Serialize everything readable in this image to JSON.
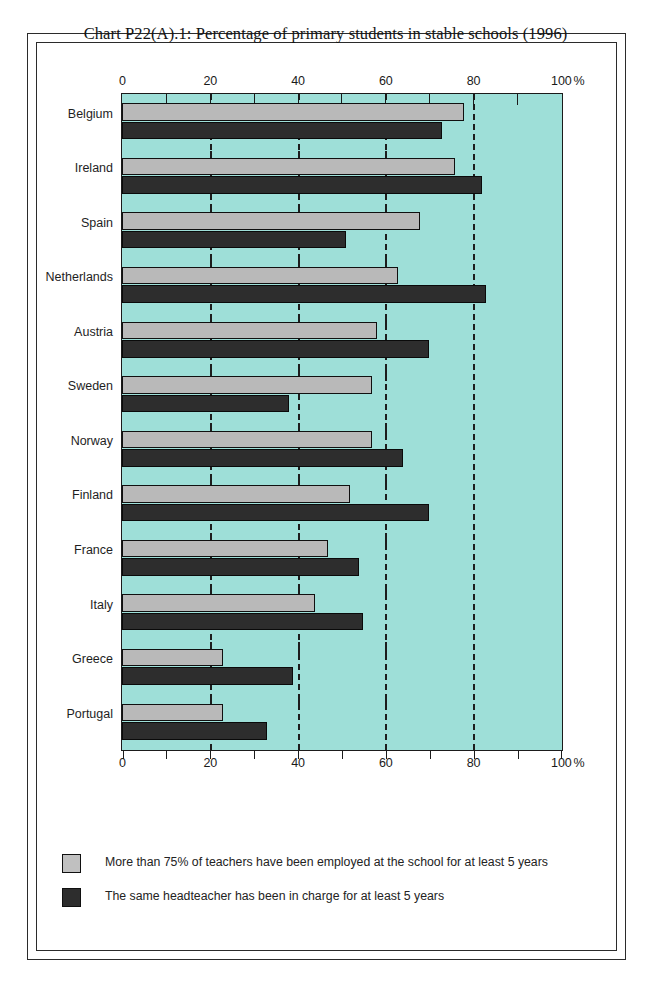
{
  "chart_data": {
    "type": "bar",
    "orientation": "horizontal",
    "title": "Chart P22(A).1: Percentage of primary students in stable schools (1996)",
    "xlabel": "",
    "ylabel": "",
    "unit": "%",
    "xlim": [
      0,
      100
    ],
    "xticks": [
      0,
      20,
      40,
      60,
      80,
      100
    ],
    "xtick_labels": [
      "0",
      "20",
      "40",
      "60",
      "80",
      "100"
    ],
    "minor_tick_step": 10,
    "gridlines": [
      20,
      40,
      60,
      80
    ],
    "grid": true,
    "axis_label_positions": [
      "top",
      "bottom"
    ],
    "legend_position": "below",
    "categories": [
      "Belgium",
      "Ireland",
      "Spain",
      "Netherlands",
      "Austria",
      "Sweden",
      "Norway",
      "Finland",
      "France",
      "Italy",
      "Greece",
      "Portugal"
    ],
    "series": [
      {
        "name": "More than 75% of teachers have been employed at the school for at least 5 years",
        "color": "#b9b9b9",
        "values": [
          78,
          76,
          68,
          63,
          58,
          57,
          57,
          52,
          47,
          44,
          23,
          23
        ]
      },
      {
        "name": "The same headteacher has been in charge for at least 5 years",
        "color": "#2d2d2d",
        "values": [
          73,
          82,
          51,
          83,
          70,
          38,
          64,
          70,
          54,
          55,
          39,
          33
        ]
      }
    ],
    "plot_background_color": "#9edfd8",
    "frame_color": "#2b2b2b"
  },
  "axis": {
    "unit_suffix": "%"
  },
  "legend": {
    "items": [
      {
        "swatch": "light",
        "label": "More than 75% of teachers have been employed at the school for at least 5 years"
      },
      {
        "swatch": "dark",
        "label": "The same headteacher has been in charge for at least 5 years"
      }
    ]
  }
}
